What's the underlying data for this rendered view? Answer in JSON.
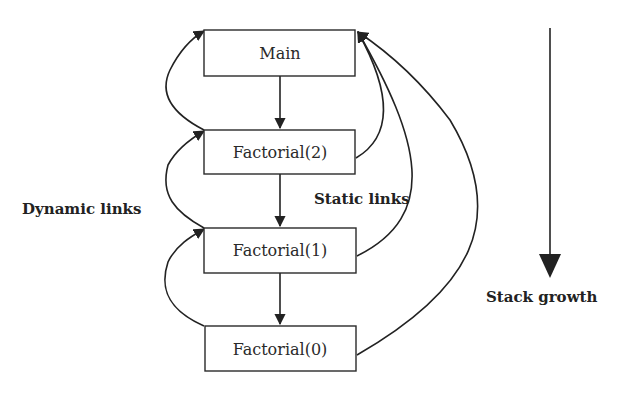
{
  "frames": [
    {
      "id": "main",
      "label": "Main"
    },
    {
      "id": "f2",
      "label": "Factorial(2)"
    },
    {
      "id": "f1",
      "label": "Factorial(1)"
    },
    {
      "id": "f0",
      "label": "Factorial(0)"
    }
  ],
  "annotations": {
    "dynamic_links": "Dynamic links",
    "static_links": "Static links",
    "stack_growth": "Stack growth"
  },
  "colors": {
    "stroke": "#222222",
    "background": "#ffffff"
  }
}
